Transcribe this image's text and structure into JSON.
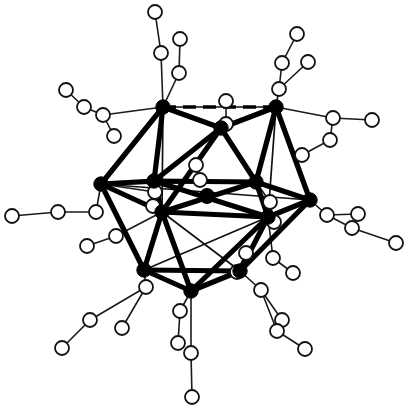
{
  "figure": {
    "kind": "molecular-structure-diagram",
    "background_color": "#ffffff",
    "width": 409,
    "height": 410,
    "caption": ""
  },
  "style": {
    "filled_atom_color": "#000000",
    "open_atom_fill": "#ffffff",
    "open_atom_stroke": "#121212",
    "core_bond_color": "#000000",
    "thin_bond_color": "#111111",
    "ligand_bond_color": "#1a1a1a",
    "filled_atom_radius": 7.2,
    "open_atom_radius": 7.0,
    "center_atom_radius": 7.5,
    "core_bond_width": 5.2,
    "thin_bond_width": 1.7,
    "ligand_bond_width": 1.6,
    "open_atom_stroke_width": 1.8
  },
  "legend": {
    "filled_atom_label": "metal atom",
    "open_atom_label": "ligand atom",
    "center_atom_label": "interstitial atom"
  },
  "chart_data": {
    "type": "scatter",
    "xlabel": "",
    "ylabel": "",
    "grid": false,
    "legend_position": "none",
    "xlim": [
      0,
      409
    ],
    "ylim": [
      0,
      410
    ],
    "center_atom": {
      "id": "X0",
      "x": 207,
      "y": 196,
      "r": 7.5
    },
    "metal_atoms": [
      {
        "id": "M1",
        "x": 163,
        "y": 107
      },
      {
        "id": "M2",
        "x": 276,
        "y": 107
      },
      {
        "id": "M3",
        "x": 221,
        "y": 128
      },
      {
        "id": "M4",
        "x": 101,
        "y": 184
      },
      {
        "id": "M5",
        "x": 154,
        "y": 181
      },
      {
        "id": "M6",
        "x": 256,
        "y": 182
      },
      {
        "id": "M7",
        "x": 310,
        "y": 200
      },
      {
        "id": "M8",
        "x": 162,
        "y": 212
      },
      {
        "id": "M9",
        "x": 268,
        "y": 217
      },
      {
        "id": "M10",
        "x": 144,
        "y": 270
      },
      {
        "id": "M11",
        "x": 240,
        "y": 271
      },
      {
        "id": "M12",
        "x": 191,
        "y": 291
      }
    ],
    "core_bonds": [
      [
        "M1",
        "M3"
      ],
      [
        "M3",
        "M2"
      ],
      [
        "M1",
        "M5"
      ],
      [
        "M1",
        "M4"
      ],
      [
        "M3",
        "M5"
      ],
      [
        "M3",
        "M6"
      ],
      [
        "M2",
        "M6"
      ],
      [
        "M2",
        "M7"
      ],
      [
        "M5",
        "M6"
      ],
      [
        "M4",
        "M5"
      ],
      [
        "M6",
        "M7"
      ],
      [
        "M4",
        "M8"
      ],
      [
        "M5",
        "M8"
      ],
      [
        "M5",
        "M9"
      ],
      [
        "M6",
        "M9"
      ],
      [
        "M7",
        "M9"
      ],
      [
        "M8",
        "M9"
      ],
      [
        "M8",
        "M10"
      ],
      [
        "M8",
        "M12"
      ],
      [
        "M9",
        "M11"
      ],
      [
        "M9",
        "M12"
      ],
      [
        "M10",
        "M12"
      ],
      [
        "M12",
        "M11"
      ],
      [
        "M10",
        "M11"
      ],
      [
        "M4",
        "M10"
      ],
      [
        "M7",
        "M11"
      ],
      [
        "M6",
        "M8"
      ],
      [
        "M3",
        "M8"
      ]
    ],
    "thin_edges": [
      [
        "M1",
        "M2"
      ],
      [
        "M4",
        "M6"
      ],
      [
        "M4",
        "M7"
      ],
      [
        "M8",
        "M11"
      ],
      [
        "M10",
        "M9"
      ],
      [
        "M2",
        "M9"
      ],
      [
        "M1",
        "M8"
      ]
    ],
    "dashed_edges": [
      [
        "M1",
        "M2"
      ],
      [
        "M10",
        "M11"
      ],
      [
        "M7",
        "M9"
      ]
    ],
    "ligand_atoms": [
      {
        "id": "L1",
        "x": 155,
        "y": 12
      },
      {
        "id": "L2",
        "x": 161,
        "y": 53
      },
      {
        "id": "L3",
        "x": 180,
        "y": 39
      },
      {
        "id": "L4",
        "x": 179,
        "y": 73
      },
      {
        "id": "L5",
        "x": 226,
        "y": 101
      },
      {
        "id": "L6",
        "x": 226,
        "y": 124
      },
      {
        "id": "L7",
        "x": 297,
        "y": 34
      },
      {
        "id": "L8",
        "x": 282,
        "y": 63
      },
      {
        "id": "L9",
        "x": 308,
        "y": 62
      },
      {
        "id": "L10",
        "x": 279,
        "y": 89
      },
      {
        "id": "L11",
        "x": 66,
        "y": 90
      },
      {
        "id": "L12",
        "x": 84,
        "y": 107
      },
      {
        "id": "L13",
        "x": 103,
        "y": 115
      },
      {
        "id": "L14",
        "x": 114,
        "y": 136
      },
      {
        "id": "L15",
        "x": 333,
        "y": 118
      },
      {
        "id": "L16",
        "x": 372,
        "y": 120
      },
      {
        "id": "L17",
        "x": 330,
        "y": 140
      },
      {
        "id": "L18",
        "x": 302,
        "y": 155
      },
      {
        "id": "L19",
        "x": 196,
        "y": 165
      },
      {
        "id": "L20",
        "x": 200,
        "y": 180
      },
      {
        "id": "L21",
        "x": 155,
        "y": 192
      },
      {
        "id": "L22",
        "x": 153,
        "y": 206
      },
      {
        "id": "L23",
        "x": 12,
        "y": 216
      },
      {
        "id": "L24",
        "x": 58,
        "y": 212
      },
      {
        "id": "L25",
        "x": 96,
        "y": 212
      },
      {
        "id": "L26",
        "x": 270,
        "y": 202
      },
      {
        "id": "L27",
        "x": 274,
        "y": 222
      },
      {
        "id": "L28",
        "x": 327,
        "y": 215
      },
      {
        "id": "L29",
        "x": 358,
        "y": 214
      },
      {
        "id": "L30",
        "x": 352,
        "y": 228
      },
      {
        "id": "L31",
        "x": 396,
        "y": 243
      },
      {
        "id": "L32",
        "x": 116,
        "y": 236
      },
      {
        "id": "L33",
        "x": 87,
        "y": 246
      },
      {
        "id": "L34",
        "x": 273,
        "y": 258
      },
      {
        "id": "L35",
        "x": 293,
        "y": 273
      },
      {
        "id": "L36",
        "x": 146,
        "y": 287
      },
      {
        "id": "L37",
        "x": 90,
        "y": 320
      },
      {
        "id": "L38",
        "x": 62,
        "y": 348
      },
      {
        "id": "L39",
        "x": 122,
        "y": 328
      },
      {
        "id": "L40",
        "x": 180,
        "y": 311
      },
      {
        "id": "L41",
        "x": 178,
        "y": 343
      },
      {
        "id": "L42",
        "x": 191,
        "y": 353
      },
      {
        "id": "L43",
        "x": 192,
        "y": 397
      },
      {
        "id": "L44",
        "x": 261,
        "y": 290
      },
      {
        "id": "L45",
        "x": 282,
        "y": 320
      },
      {
        "id": "L46",
        "x": 277,
        "y": 331
      },
      {
        "id": "L47",
        "x": 305,
        "y": 349
      },
      {
        "id": "L48",
        "x": 237,
        "y": 272
      },
      {
        "id": "L49",
        "x": 246,
        "y": 253
      }
    ],
    "ligand_bonds": [
      [
        "M1",
        "L2"
      ],
      [
        "L2",
        "L1"
      ],
      [
        "M1",
        "L4"
      ],
      [
        "L4",
        "L3"
      ],
      [
        "M1",
        "L13"
      ],
      [
        "L13",
        "L12"
      ],
      [
        "L12",
        "L11"
      ],
      [
        "L13",
        "L14"
      ],
      [
        "M3",
        "L6"
      ],
      [
        "L6",
        "L5"
      ],
      [
        "M2",
        "L10"
      ],
      [
        "L10",
        "L8"
      ],
      [
        "L8",
        "L7"
      ],
      [
        "L10",
        "L9"
      ],
      [
        "M2",
        "L15"
      ],
      [
        "L15",
        "L16"
      ],
      [
        "L15",
        "L17"
      ],
      [
        "L17",
        "L18"
      ],
      [
        "M4",
        "L25"
      ],
      [
        "L25",
        "L24"
      ],
      [
        "L24",
        "L23"
      ],
      [
        "M4",
        "L21"
      ],
      [
        "L21",
        "L22"
      ],
      [
        "M5",
        "L20"
      ],
      [
        "L20",
        "L19"
      ],
      [
        "M6",
        "L26"
      ],
      [
        "L26",
        "L27"
      ],
      [
        "M7",
        "L28"
      ],
      [
        "L28",
        "L29"
      ],
      [
        "L28",
        "L30"
      ],
      [
        "L30",
        "L31"
      ],
      [
        "M8",
        "L32"
      ],
      [
        "L32",
        "L33"
      ],
      [
        "M9",
        "L34"
      ],
      [
        "L34",
        "L35"
      ],
      [
        "M10",
        "L36"
      ],
      [
        "L36",
        "L37"
      ],
      [
        "L37",
        "L38"
      ],
      [
        "L36",
        "L39"
      ],
      [
        "M12",
        "L40"
      ],
      [
        "L40",
        "L41"
      ],
      [
        "M12",
        "L42"
      ],
      [
        "L42",
        "L43"
      ],
      [
        "M11",
        "L44"
      ],
      [
        "L44",
        "L45"
      ],
      [
        "L44",
        "L46"
      ],
      [
        "L46",
        "L47"
      ],
      [
        "M11",
        "L48"
      ],
      [
        "L48",
        "L49"
      ]
    ]
  }
}
